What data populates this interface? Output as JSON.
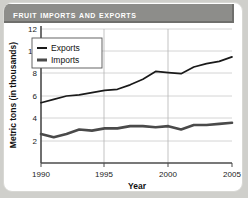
{
  "title": "Fruit Imports and Exports",
  "chart_data": {
    "type": "line",
    "title": "Fruit Imports and Exports",
    "xlabel": "Year",
    "ylabel": "Metric tons (in thousands)",
    "xlim": [
      1990,
      2005
    ],
    "ylim": [
      0,
      12
    ],
    "xticks": [
      1990,
      1995,
      2000,
      2005
    ],
    "yticks": [
      2,
      4,
      6,
      8,
      10,
      12
    ],
    "grid": true,
    "legend_position": "top-left",
    "x": [
      1990,
      1991,
      1992,
      1993,
      1994,
      1995,
      1996,
      1997,
      1998,
      1999,
      2000,
      2001,
      2002,
      2003,
      2004,
      2005
    ],
    "series": [
      {
        "name": "Exports",
        "color": "#1a1a1a",
        "linewidth": "thin",
        "values": [
          5.4,
          5.7,
          6.0,
          6.1,
          6.3,
          6.5,
          6.6,
          7.0,
          7.5,
          8.2,
          8.1,
          8.0,
          8.6,
          8.9,
          9.1,
          9.5
        ]
      },
      {
        "name": "Imports",
        "color": "#4a4a4a",
        "linewidth": "thick",
        "values": [
          2.6,
          2.3,
          2.6,
          3.0,
          2.9,
          3.1,
          3.1,
          3.3,
          3.3,
          3.2,
          3.3,
          3.0,
          3.4,
          3.4,
          3.5,
          3.6
        ]
      }
    ]
  },
  "legend": {
    "items": [
      {
        "label": "Exports"
      },
      {
        "label": "Imports"
      }
    ]
  },
  "axis": {
    "x_label": "Year",
    "y_label": "Metric tons (in thousands)",
    "x_ticks": [
      "1990",
      "1995",
      "2000",
      "2005"
    ],
    "y_ticks": [
      "12",
      "10",
      "8",
      "6",
      "4",
      "2"
    ]
  }
}
